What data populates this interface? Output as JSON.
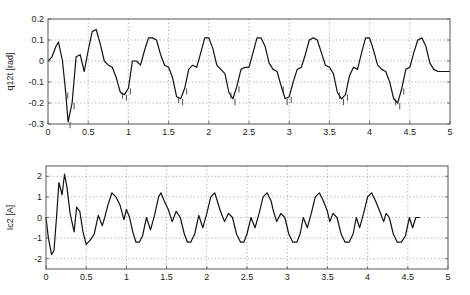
{
  "chart_data": [
    {
      "type": "line",
      "title": "",
      "xlabel": "",
      "ylabel": "q12t [rad]",
      "xlim": [
        0,
        5
      ],
      "ylim": [
        -0.3,
        0.2
      ],
      "xticks": [
        "0",
        "0.5",
        "1",
        "1.5",
        "2",
        "2.5",
        "3",
        "3.5",
        "4",
        "4.5",
        "5"
      ],
      "yticks": [
        "0.2",
        "0.1",
        "0",
        "-0.1",
        "-0.2",
        "-0.3"
      ],
      "grid": true,
      "legend": null,
      "series": [
        {
          "name": "q12t",
          "x": [
            0,
            0.05,
            0.1,
            0.13,
            0.18,
            0.22,
            0.25,
            0.3,
            0.35,
            0.4,
            0.45,
            0.5,
            0.55,
            0.6,
            0.65,
            0.7,
            0.75,
            0.8,
            0.85,
            0.9,
            0.95,
            1.0,
            1.05,
            1.1,
            1.15,
            1.2,
            1.25,
            1.3,
            1.35,
            1.4,
            1.45,
            1.5,
            1.55,
            1.6,
            1.65,
            1.7,
            1.75,
            1.8,
            1.85,
            1.9,
            1.95,
            2.0,
            2.05,
            2.1,
            2.15,
            2.2,
            2.25,
            2.3,
            2.35,
            2.4,
            2.45,
            2.5,
            2.55,
            2.6,
            2.65,
            2.7,
            2.75,
            2.8,
            2.85,
            2.9,
            2.95,
            3.0,
            3.05,
            3.1,
            3.15,
            3.2,
            3.25,
            3.3,
            3.35,
            3.4,
            3.45,
            3.5,
            3.55,
            3.6,
            3.65,
            3.7,
            3.75,
            3.8,
            3.85,
            3.9,
            3.95,
            4.0,
            4.05,
            4.1,
            4.15,
            4.2,
            4.25,
            4.3,
            4.35,
            4.4,
            4.45,
            4.5,
            4.55,
            4.6,
            4.65,
            4.7,
            4.75,
            4.8,
            4.85,
            4.9,
            4.95,
            5.0
          ],
          "y": [
            0.0,
            0.02,
            0.07,
            0.09,
            0.0,
            -0.15,
            -0.29,
            -0.2,
            0.02,
            0.03,
            -0.05,
            0.05,
            0.14,
            0.15,
            0.08,
            0.0,
            -0.02,
            -0.03,
            -0.08,
            -0.15,
            -0.16,
            -0.13,
            0.0,
            0.0,
            -0.02,
            0.05,
            0.11,
            0.11,
            0.1,
            0.03,
            -0.02,
            -0.03,
            -0.08,
            -0.17,
            -0.18,
            -0.13,
            -0.04,
            -0.02,
            -0.03,
            0.04,
            0.11,
            0.11,
            0.06,
            -0.02,
            -0.04,
            -0.06,
            -0.15,
            -0.18,
            -0.12,
            -0.04,
            -0.03,
            -0.03,
            0.04,
            0.11,
            0.11,
            0.07,
            -0.01,
            -0.04,
            -0.05,
            -0.12,
            -0.18,
            -0.17,
            -0.1,
            -0.04,
            -0.03,
            0.03,
            0.1,
            0.11,
            0.1,
            0.04,
            -0.02,
            -0.03,
            -0.06,
            -0.15,
            -0.18,
            -0.16,
            -0.07,
            -0.03,
            -0.04,
            0.04,
            0.11,
            0.11,
            0.05,
            -0.02,
            -0.04,
            -0.05,
            -0.1,
            -0.18,
            -0.2,
            -0.13,
            -0.04,
            -0.03,
            0.04,
            0.1,
            0.11,
            0.07,
            -0.01,
            -0.04,
            -0.05,
            -0.05,
            -0.05,
            -0.05
          ]
        }
      ]
    },
    {
      "type": "line",
      "title": "",
      "xlabel": "",
      "ylabel": "Ic2 [A]",
      "xlim": [
        0,
        5
      ],
      "ylim": [
        -2.5,
        2.5
      ],
      "xticks": [
        "0",
        "0.5",
        "1",
        "1.5",
        "2",
        "2.5",
        "3",
        "3.5",
        "4",
        "4.5",
        "5"
      ],
      "yticks": [
        "2",
        "1",
        "0",
        "-1",
        "-2"
      ],
      "grid": true,
      "legend": null,
      "series": [
        {
          "name": "Ic2",
          "x": [
            0,
            0.03,
            0.07,
            0.1,
            0.13,
            0.16,
            0.2,
            0.23,
            0.26,
            0.3,
            0.35,
            0.38,
            0.42,
            0.46,
            0.5,
            0.55,
            0.6,
            0.65,
            0.7,
            0.73,
            0.77,
            0.82,
            0.87,
            0.92,
            0.97,
            1.0,
            1.04,
            1.08,
            1.12,
            1.16,
            1.2,
            1.25,
            1.3,
            1.35,
            1.4,
            1.43,
            1.47,
            1.52,
            1.57,
            1.62,
            1.67,
            1.72,
            1.76,
            1.8,
            1.85,
            1.9,
            1.95,
            2.0,
            2.05,
            2.1,
            2.13,
            2.17,
            2.22,
            2.27,
            2.32,
            2.37,
            2.42,
            2.46,
            2.5,
            2.55,
            2.6,
            2.65,
            2.7,
            2.75,
            2.8,
            2.83,
            2.87,
            2.92,
            2.97,
            3.02,
            3.07,
            3.12,
            3.16,
            3.2,
            3.25,
            3.3,
            3.35,
            3.4,
            3.45,
            3.5,
            3.53,
            3.57,
            3.62,
            3.67,
            3.72,
            3.77,
            3.82,
            3.86,
            3.9,
            3.95,
            4.0,
            4.05,
            4.1,
            4.15,
            4.2,
            4.23,
            4.27,
            4.32,
            4.37,
            4.42,
            4.47,
            4.52,
            4.56,
            4.6,
            4.65,
            4.7,
            4.75,
            4.8,
            4.85,
            4.9,
            4.93,
            4.96,
            5.0
          ],
          "y": [
            0.0,
            -1.0,
            -1.8,
            -1.6,
            0.0,
            1.7,
            1.1,
            2.1,
            1.5,
            0.2,
            -0.7,
            0.5,
            0.3,
            -0.7,
            -1.3,
            -1.1,
            -0.8,
            0.1,
            -0.4,
            0.0,
            0.6,
            1.2,
            1.0,
            0.6,
            -0.1,
            0.4,
            0.0,
            -0.7,
            -1.2,
            -1.2,
            -0.9,
            0.0,
            -0.6,
            0.1,
            1.0,
            1.2,
            0.8,
            0.4,
            -0.2,
            0.3,
            0.0,
            -0.8,
            -1.2,
            -1.2,
            -0.8,
            0.1,
            -0.5,
            0.2,
            1.0,
            1.2,
            0.8,
            0.3,
            -0.2,
            0.2,
            0.0,
            -0.8,
            -1.2,
            -1.2,
            -0.8,
            0.0,
            -0.5,
            0.2,
            1.0,
            1.2,
            0.8,
            0.3,
            -0.2,
            0.2,
            0.0,
            -0.8,
            -1.2,
            -1.2,
            -0.8,
            0.0,
            -0.5,
            0.2,
            1.0,
            1.2,
            0.8,
            0.3,
            -0.2,
            0.2,
            0.0,
            -0.8,
            -1.2,
            -1.2,
            -0.8,
            0.0,
            -0.5,
            0.2,
            1.0,
            1.2,
            0.8,
            0.3,
            -0.2,
            0.2,
            0.0,
            -0.8,
            -1.2,
            -1.2,
            -0.9,
            0.0,
            -0.5,
            0.0,
            0.0
          ]
        }
      ]
    }
  ],
  "plots": {
    "top": {
      "ylabel": "q12t [rad]"
    },
    "bottom": {
      "ylabel": "Ic2 [A]"
    }
  }
}
